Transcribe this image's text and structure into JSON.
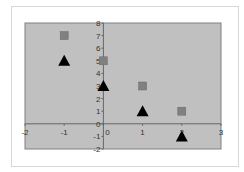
{
  "chart_data": {
    "type": "scatter",
    "title": "",
    "xlabel": "",
    "ylabel": "",
    "xlim": [
      -2,
      3
    ],
    "ylim": [
      -2,
      8
    ],
    "x_ticks": [
      "-2",
      "-1",
      "0",
      "1",
      "2",
      "3"
    ],
    "y_ticks": [
      "-2",
      "-1",
      "0",
      "1",
      "2",
      "3",
      "4",
      "5",
      "6",
      "7",
      "8"
    ],
    "grid": false,
    "legend": "none",
    "plot_background": "#c0c0c0",
    "series": [
      {
        "name": "Series 1",
        "marker": "square",
        "color": "#808080",
        "points": [
          {
            "x": -1,
            "y": 7
          },
          {
            "x": 0,
            "y": 5
          },
          {
            "x": 1,
            "y": 3
          },
          {
            "x": 2,
            "y": 1
          }
        ]
      },
      {
        "name": "Series 2",
        "marker": "triangle",
        "color": "#000000",
        "points": [
          {
            "x": -1,
            "y": 5
          },
          {
            "x": 0,
            "y": 3
          },
          {
            "x": 1,
            "y": 1
          },
          {
            "x": 2,
            "y": -1
          }
        ]
      }
    ]
  }
}
